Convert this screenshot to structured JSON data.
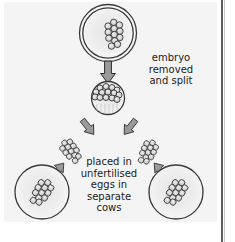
{
  "figure": {
    "background_color": "#f4f4f4",
    "page_color": "#ffffff",
    "ink_color": "#1b1b1b",
    "cell_fill": "#d9d9d9",
    "arrow_fill": "#9a9a9a",
    "egg_fill": "#efefef"
  },
  "captions": {
    "embryo_removed": "embryo\nremoved\nand split",
    "placed_in_eggs": "placed in\nunfertilised\neggs in\nseparate\ncows"
  },
  "stages": {
    "donor_egg": {
      "name": "fertilised egg with embryo",
      "shape": "double-ring-circle"
    },
    "embryo": {
      "name": "removed embryo (morula)",
      "shape": "filled-cell-ball"
    },
    "half_embryo_left": {
      "name": "split embryo half",
      "shape": "cell-cluster"
    },
    "half_embryo_right": {
      "name": "split embryo half",
      "shape": "cell-cluster"
    },
    "recipient_egg_left": {
      "name": "unfertilised egg in recipient cow",
      "shape": "ring-circle"
    },
    "recipient_egg_right": {
      "name": "unfertilised egg in recipient cow",
      "shape": "ring-circle"
    }
  },
  "arrows": {
    "removal": "down",
    "split_left": "down-left",
    "split_right": "down-right",
    "implant_left": "down-left",
    "implant_right": "down-right"
  }
}
